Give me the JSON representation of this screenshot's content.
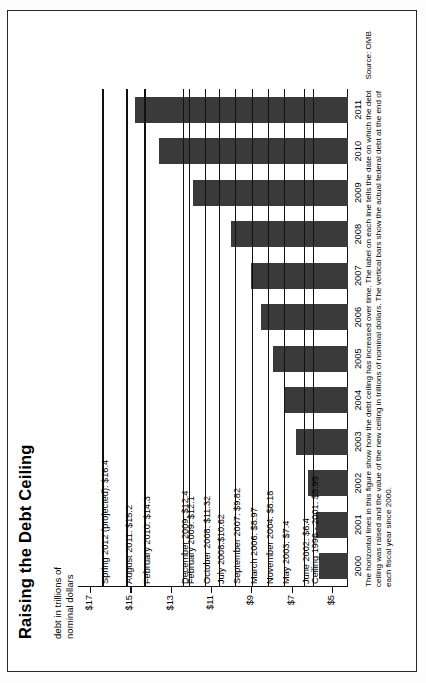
{
  "figure": {
    "title": "Raising the Debt Ceiling",
    "axis_caption": "debt in trillions of\nnominal dollars",
    "footnote": "The horizontal lines in this figure show how the debt ceiling has increased over time.  The label on each line tells the date on which the debt\nceiling was raised and the value of the new ceiling in trillions of nominal dollars.  The vertical bars show the actual federal debt at the end of each\nfiscal year since 2000.",
    "source": "Source: OMB"
  },
  "chart_data": {
    "type": "bar",
    "title": "Raising the Debt Ceiling",
    "xlabel": "",
    "ylabel": "debt in trillions of nominal dollars",
    "ylim": [
      4.2,
      17.6
    ],
    "grid": false,
    "legend": "none",
    "orientation": "vertical-bars-with-horizontal-threshold-lines",
    "categories": [
      "2000",
      "2001",
      "2002",
      "2003",
      "2004",
      "2005",
      "2006",
      "2007",
      "2008",
      "2009",
      "2010",
      "2011"
    ],
    "tick_labels": [
      "$5",
      "$7",
      "$9",
      "$11",
      "$13",
      "$15",
      "$17"
    ],
    "tick_values": [
      5,
      7,
      9,
      11,
      13,
      15,
      17
    ],
    "series": [
      {
        "name": "Actual federal debt at end of fiscal year",
        "values": [
          5.63,
          5.81,
          6.2,
          6.78,
          7.38,
          7.93,
          8.51,
          9.01,
          10.02,
          11.91,
          13.56,
          14.79
        ]
      }
    ],
    "ceiling_lines": [
      {
        "label": "Spring 2012 (projected): $16.4",
        "value": 16.4,
        "date": "Spring 2012 (projected)"
      },
      {
        "label": "August 2011: $15.2",
        "value": 15.2,
        "date": "August 2011"
      },
      {
        "label": "February 2010: $14.3",
        "value": 14.3,
        "date": "February 2010"
      },
      {
        "label": "December 2009: $12.4",
        "value": 12.4,
        "date": "December 2009"
      },
      {
        "label": "February 2009: $12.1",
        "value": 12.1,
        "date": "February 2009"
      },
      {
        "label": "October 2008: $11.32",
        "value": 11.32,
        "date": "October 2008"
      },
      {
        "label": "July 2008:$10.62",
        "value": 10.62,
        "date": "July 2008"
      },
      {
        "label": "September 2007: $9.82",
        "value": 9.82,
        "date": "September 2007"
      },
      {
        "label": "March 2006: $8.97",
        "value": 8.97,
        "date": "March 2006"
      },
      {
        "label": "November 2004: $8.18",
        "value": 8.18,
        "date": "November 2004"
      },
      {
        "label": "May 2003: $7.4",
        "value": 7.4,
        "date": "May 2003"
      },
      {
        "label": "June 2002: $6.4",
        "value": 6.4,
        "date": "June 2002"
      },
      {
        "label": "Ceiling 1996 - 2001: $5.95",
        "value": 5.95,
        "date": "Ceiling 1996 - 2001"
      }
    ],
    "bar_color": "#3a3a3a",
    "line_color": "#111111"
  }
}
